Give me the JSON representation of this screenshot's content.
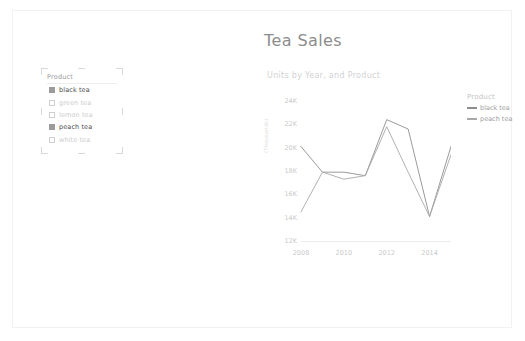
{
  "report": {
    "title": "Tea Sales"
  },
  "slicer": {
    "header": "Product",
    "items": [
      {
        "label": "black tea",
        "selected": true
      },
      {
        "label": "green tea",
        "selected": false
      },
      {
        "label": "lemon tea",
        "selected": false
      },
      {
        "label": "peach tea",
        "selected": true
      },
      {
        "label": "white tea",
        "selected": false
      }
    ]
  },
  "legend": {
    "title": "Product",
    "items": [
      {
        "label": "black tea",
        "color": "#8e8e8e"
      },
      {
        "label": "peach tea",
        "color": "#a8a8a8"
      }
    ]
  },
  "chart_data": {
    "type": "line",
    "title": "Units by Year, and Product",
    "xlabel": "",
    "ylabel": "(Thousands)",
    "x": [
      2008,
      2009,
      2010,
      2011,
      2012,
      2013,
      2014,
      2015
    ],
    "xtick_labels": [
      "2008",
      "2010",
      "2012",
      "2014"
    ],
    "xticks": [
      2008,
      2010,
      2012,
      2014
    ],
    "ytick_labels": [
      "24K",
      "22K",
      "20K",
      "18K",
      "16K",
      "14K",
      "12K"
    ],
    "yticks": [
      24000,
      22000,
      20000,
      18000,
      16000,
      14000,
      12000
    ],
    "ylim": [
      12000,
      24000
    ],
    "xlim": [
      2008,
      2015
    ],
    "grid": false,
    "legend_position": "right",
    "series": [
      {
        "name": "black tea",
        "color": "#8e8e8e",
        "values": [
          20100,
          17900,
          17900,
          17600,
          22400,
          21600,
          14100,
          20100
        ]
      },
      {
        "name": "peach tea",
        "color": "#a8a8a8",
        "values": [
          14500,
          17900,
          17300,
          17600,
          21800,
          17900,
          14100,
          19400
        ]
      }
    ]
  }
}
